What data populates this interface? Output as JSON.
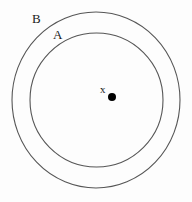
{
  "figure": {
    "type": "set-diagram",
    "background_color": "#fdfdfd",
    "stroke_color": "#565656",
    "point_color": "#000000",
    "text_color": "#1a1a1a",
    "width": 192,
    "height": 202
  },
  "labels": {
    "outer_set": "B",
    "inner_set": "A",
    "point": "x"
  },
  "shapes": {
    "outer_circle": {
      "name": "B",
      "cx": 96,
      "cy": 100,
      "rx": 84,
      "ry": 88,
      "filled": false
    },
    "inner_circle": {
      "name": "A",
      "cx": 96.5,
      "cy": 100,
      "rx": 66.5,
      "ry": 67,
      "filled": false
    },
    "point_marker": {
      "name": "x",
      "cx": 112,
      "cy": 97,
      "r": 4,
      "filled": true
    }
  }
}
